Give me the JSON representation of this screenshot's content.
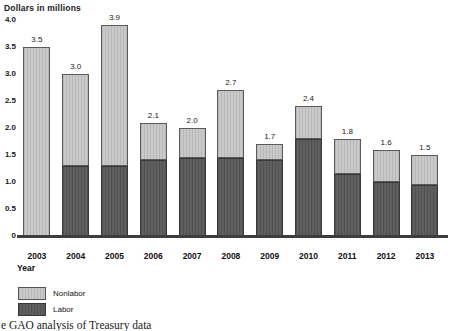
{
  "title": "Dollars in millions",
  "chart_data": {
    "type": "bar",
    "stacked": true,
    "title": "Dollars in millions",
    "xlabel": "Year",
    "ylabel": "Dollars in millions",
    "categories": [
      "2003",
      "2004",
      "2005",
      "2006",
      "2007",
      "2008",
      "2009",
      "2010",
      "2011",
      "2012",
      "2013"
    ],
    "series": [
      {
        "name": "Nonlabor",
        "color": "#c9c9c9",
        "values": [
          3.5,
          1.7,
          2.6,
          0.7,
          0.55,
          1.25,
          0.3,
          0.6,
          0.65,
          0.6,
          0.55
        ]
      },
      {
        "name": "Labor",
        "color": "#5f5f5f",
        "values": [
          0.0,
          1.3,
          1.3,
          1.4,
          1.45,
          1.45,
          1.4,
          1.8,
          1.15,
          1.0,
          0.95
        ]
      }
    ],
    "totals": [
      3.5,
      3.0,
      3.9,
      2.1,
      2.0,
      2.7,
      1.7,
      2.4,
      1.8,
      1.6,
      1.5
    ],
    "total_labels": [
      "3.5",
      "3.0",
      "3.9",
      "2.1",
      "2.0",
      "2.7",
      "1.7",
      "2.4",
      "1.8",
      "1.6",
      "1.5"
    ],
    "ylim": [
      0,
      4.0
    ],
    "yticks": [
      "4.0",
      "3.5",
      "3.0",
      "2.5",
      "2.0",
      "1.5",
      "1.0",
      "0.5",
      "0"
    ],
    "grid": false,
    "legend_position": "bottom-left"
  },
  "legend": {
    "items": [
      {
        "label": "Nonlabor",
        "color": "#c9c9c9"
      },
      {
        "label": "Labor",
        "color": "#5f5f5f"
      }
    ]
  },
  "xaxis_label": "Year",
  "source_text": "e GAO analysis of Treasury data",
  "colors": {
    "background": "#ffffff",
    "nonlabor_fill": "#c9c9c9",
    "labor_fill": "#5f5f5f",
    "axis_line": "#3d3d3d",
    "text": "#1a1a1a"
  }
}
